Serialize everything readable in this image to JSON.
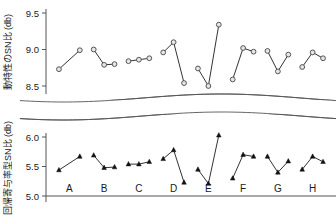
{
  "chart_data": {
    "type": "line",
    "title": "",
    "panels": [
      {
        "id": "upper",
        "ylabel": "動特性のSN比 (db)",
        "yticks": [
          "9.5",
          "9.0",
          "8.5"
        ],
        "ytick_values": [
          9.5,
          9.0,
          8.5
        ],
        "ylim": [
          8.42,
          9.56
        ],
        "marker": "open-circle",
        "series": [
          {
            "name": "A",
            "x": [
              1,
              2
            ],
            "values": [
              8.73,
              8.99
            ]
          },
          {
            "name": "B",
            "x": [
              1,
              2,
              3
            ],
            "values": [
              9.0,
              8.79,
              8.8
            ]
          },
          {
            "name": "C",
            "x": [
              1,
              2,
              3
            ],
            "values": [
              8.84,
              8.86,
              8.88
            ]
          },
          {
            "name": "D",
            "x": [
              1,
              2,
              3
            ],
            "values": [
              8.96,
              9.1,
              8.54
            ]
          },
          {
            "name": "E",
            "x": [
              1,
              2,
              3
            ],
            "values": [
              8.74,
              8.5,
              9.34
            ]
          },
          {
            "name": "F",
            "x": [
              1,
              2,
              3
            ],
            "values": [
              8.59,
              9.02,
              8.97
            ]
          },
          {
            "name": "G",
            "x": [
              1,
              2,
              3
            ],
            "values": [
              8.98,
              8.7,
              8.93
            ]
          },
          {
            "name": "H",
            "x": [
              1,
              2,
              3
            ],
            "values": [
              8.76,
              8.96,
              8.88
            ]
          }
        ]
      },
      {
        "id": "lower",
        "ylabel": "回帰寄与率型SN比 (db)",
        "yticks": [
          "6.0",
          "5.5",
          "5.0"
        ],
        "ytick_values": [
          6.0,
          5.5,
          5.0
        ],
        "ylim": [
          5.0,
          6.18
        ],
        "marker": "filled-triangle",
        "series": [
          {
            "name": "A",
            "x": [
              1,
              2
            ],
            "values": [
              5.44,
              5.67
            ]
          },
          {
            "name": "B",
            "x": [
              1,
              2,
              3
            ],
            "values": [
              5.69,
              5.48,
              5.49
            ]
          },
          {
            "name": "C",
            "x": [
              1,
              2,
              3
            ],
            "values": [
              5.54,
              5.54,
              5.58
            ]
          },
          {
            "name": "D",
            "x": [
              1,
              2,
              3
            ],
            "values": [
              5.63,
              5.78,
              5.23
            ]
          },
          {
            "name": "E",
            "x": [
              1,
              2,
              3
            ],
            "values": [
              5.45,
              5.21,
              6.03
            ]
          },
          {
            "name": "F",
            "x": [
              1,
              2,
              3
            ],
            "values": [
              5.3,
              5.7,
              5.67
            ]
          },
          {
            "name": "G",
            "x": [
              1,
              2,
              3
            ],
            "values": [
              5.67,
              5.4,
              5.59
            ]
          },
          {
            "name": "H",
            "x": [
              1,
              2,
              3
            ],
            "values": [
              5.45,
              5.67,
              5.58
            ]
          }
        ]
      }
    ],
    "categories": [
      "A",
      "B",
      "C",
      "D",
      "E",
      "F",
      "G",
      "H"
    ],
    "xlabel": "",
    "grid": false,
    "legend": null,
    "axis_break": true,
    "colors": {
      "axis": "#555555",
      "line": "#333333",
      "marker_upper_fill": "#e6e6e6",
      "marker_upper_stroke": "#555555",
      "marker_lower_fill": "#111111",
      "text": "#1a1a1a"
    }
  }
}
